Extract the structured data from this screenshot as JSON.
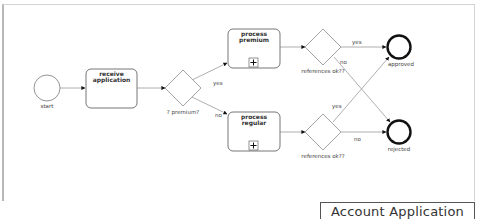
{
  "diagram": {
    "type": "BPMN process",
    "title": "Account Application",
    "nodes": {
      "start": {
        "kind": "start-event",
        "label": "start"
      },
      "receive": {
        "kind": "task",
        "label_line1": "receive",
        "label_line2": "application"
      },
      "gw_premium": {
        "kind": "exclusive-gateway",
        "label": "? premium?"
      },
      "premium": {
        "kind": "subprocess",
        "label_line1": "process",
        "label_line2": "premium",
        "marker": "+"
      },
      "regular": {
        "kind": "subprocess",
        "label_line1": "process",
        "label_line2": "regular",
        "marker": "+"
      },
      "gw_ref_top": {
        "kind": "exclusive-gateway",
        "label": "references ok??"
      },
      "gw_ref_bottom": {
        "kind": "exclusive-gateway",
        "label": "references ok??"
      },
      "approved": {
        "kind": "end-event",
        "label": "approved"
      },
      "rejected": {
        "kind": "end-event",
        "label": "rejected"
      }
    },
    "edges": {
      "premium_yes": "yes",
      "premium_no": "no",
      "top_yes": "yes",
      "top_no": "no",
      "bottom_yes": "yes",
      "bottom_no": "no"
    }
  }
}
